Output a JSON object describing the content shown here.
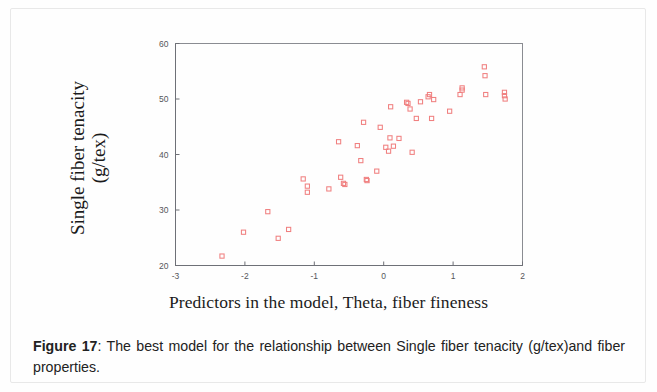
{
  "document": {
    "figure_label": "Figure 17",
    "caption_prefix": "Figure 17",
    "caption_separator": ":",
    "caption_text": " The best model for the relationship between Single fiber tenacity (g/tex)and fiber properties."
  },
  "axis_label_x": "Predictors in the model, Theta, fiber fineness",
  "axis_label_y_line1": "Single fiber tenacity",
  "axis_label_y_line2": "(g/tex)",
  "colors": {
    "marker": "#f08080",
    "axis": "#6e7077",
    "frame": "#8a8c92",
    "text": "#1b1b1b",
    "page": "#fefefe"
  },
  "chart_data": {
    "type": "scatter",
    "title": "",
    "xlabel": "Predictors in the model, Theta, fiber fineness",
    "ylabel": "Single fiber tenacity (g/tex)",
    "xlim": [
      -3,
      2
    ],
    "ylim": [
      20,
      60
    ],
    "xticks": [
      -3,
      -2,
      -1,
      0,
      1,
      2
    ],
    "xtick_labels": [
      "-3",
      "-2",
      "-1",
      "0",
      "1",
      "2"
    ],
    "yticks": [
      20,
      30,
      40,
      50,
      60
    ],
    "ytick_labels": [
      "20",
      "30",
      "40",
      "50",
      "60"
    ],
    "grid": false,
    "legend": null,
    "marker": "open-square",
    "marker_color": "#f08080",
    "series": [
      {
        "name": "Single fiber tenacity vs predicted",
        "points": [
          [
            -2.33,
            21.7
          ],
          [
            -2.02,
            26.0
          ],
          [
            -1.67,
            29.7
          ],
          [
            -1.52,
            24.9
          ],
          [
            -1.37,
            26.5
          ],
          [
            -1.16,
            35.6
          ],
          [
            -1.1,
            34.3
          ],
          [
            -1.1,
            33.2
          ],
          [
            -0.79,
            33.8
          ],
          [
            -0.65,
            42.3
          ],
          [
            -0.62,
            35.9
          ],
          [
            -0.58,
            34.8
          ],
          [
            -0.56,
            34.6
          ],
          [
            -0.38,
            41.6
          ],
          [
            -0.33,
            38.9
          ],
          [
            -0.29,
            45.8
          ],
          [
            -0.25,
            35.5
          ],
          [
            -0.24,
            35.3
          ],
          [
            -0.1,
            37.0
          ],
          [
            -0.05,
            44.9
          ],
          [
            0.03,
            41.3
          ],
          [
            0.07,
            40.6
          ],
          [
            0.09,
            43.0
          ],
          [
            0.1,
            48.6
          ],
          [
            0.14,
            41.5
          ],
          [
            0.22,
            42.9
          ],
          [
            0.33,
            49.4
          ],
          [
            0.35,
            49.2
          ],
          [
            0.38,
            48.2
          ],
          [
            0.41,
            40.4
          ],
          [
            0.47,
            46.5
          ],
          [
            0.53,
            49.5
          ],
          [
            0.64,
            50.4
          ],
          [
            0.66,
            50.8
          ],
          [
            0.69,
            46.5
          ],
          [
            0.72,
            49.9
          ],
          [
            0.95,
            47.8
          ],
          [
            1.1,
            50.8
          ],
          [
            1.13,
            51.6
          ],
          [
            1.13,
            52.0
          ],
          [
            1.45,
            55.8
          ],
          [
            1.46,
            54.2
          ],
          [
            1.47,
            50.8
          ],
          [
            1.74,
            51.2
          ],
          [
            1.74,
            50.6
          ],
          [
            1.75,
            50.0
          ]
        ]
      }
    ]
  }
}
